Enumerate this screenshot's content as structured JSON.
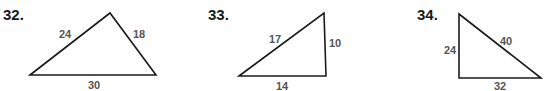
{
  "problems": [
    {
      "number": "32.",
      "sides": {
        "left": "24",
        "right": "18",
        "bottom": "30"
      },
      "vertices": [
        [
          30,
          75
        ],
        [
          110,
          13
        ],
        [
          156,
          75
        ]
      ]
    },
    {
      "number": "33.",
      "sides": {
        "hypotenuse": "17",
        "right": "10",
        "bottom": "14"
      },
      "vertices": [
        [
          239,
          76
        ],
        [
          324,
          13
        ],
        [
          326,
          76
        ]
      ]
    },
    {
      "number": "34.",
      "sides": {
        "left": "24",
        "hypotenuse": "40",
        "bottom": "32"
      },
      "vertices": [
        [
          459,
          14
        ],
        [
          459,
          78
        ],
        [
          541,
          78
        ]
      ]
    }
  ],
  "colors": {
    "stroke": "#1a1a1a",
    "label": "#555555",
    "number": "#1a1a1a"
  }
}
